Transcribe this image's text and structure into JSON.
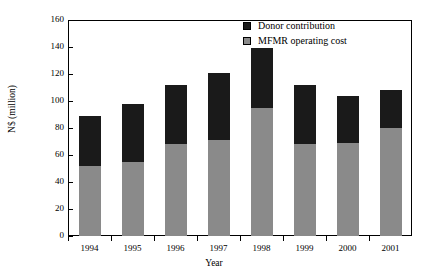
{
  "chart_data": {
    "type": "bar",
    "stacked": true,
    "title": "",
    "xlabel": "Year",
    "ylabel": "N$ (million)",
    "categories": [
      "1994",
      "1995",
      "1996",
      "1997",
      "1998",
      "1999",
      "2000",
      "2001"
    ],
    "ylim": [
      0,
      160
    ],
    "yticks": [
      0,
      20,
      40,
      60,
      80,
      100,
      120,
      140,
      160
    ],
    "grid": false,
    "legend_position": "top-right",
    "series": [
      {
        "name": "MFMR operating cost",
        "color": "#8a8a8a",
        "values": [
          52,
          55,
          68,
          71,
          95,
          68,
          69,
          80
        ]
      },
      {
        "name": "Donor contribution",
        "color": "#1a1a1a",
        "values": [
          37,
          43,
          44,
          50,
          44,
          44,
          35,
          28
        ]
      }
    ],
    "totals": [
      89,
      98,
      112,
      121,
      139,
      112,
      104,
      108
    ]
  },
  "legend": {
    "items": [
      {
        "label": "Donor contribution",
        "color": "#1a1a1a"
      },
      {
        "label": "MFMR operating cost",
        "color": "#8a8a8a"
      }
    ]
  }
}
